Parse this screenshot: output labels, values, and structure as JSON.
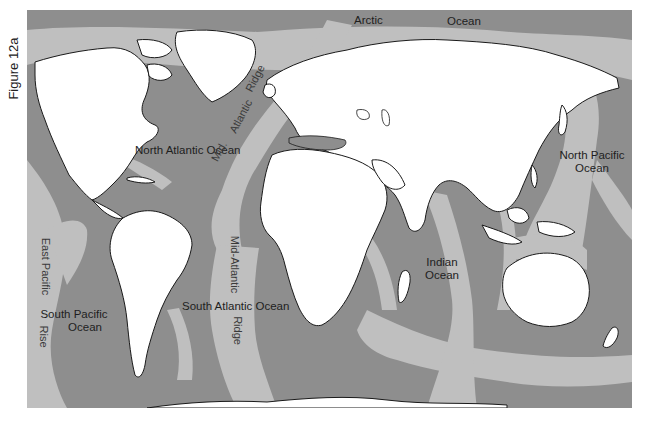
{
  "figure": {
    "label": "Figure 12a"
  },
  "map": {
    "title": "World map of ocean basins and mid-ocean ridges",
    "colors": {
      "deep_ocean": "#8e8e8e",
      "ridge_and_shelf": "#bfbfbf",
      "land": "#ffffff",
      "coastline": "#1a1a1a"
    },
    "labels": {
      "arctic": "Arctic",
      "arctic_ocean": "Ocean",
      "north_atlantic": "North Atlantic Ocean",
      "mid_atlantic_ridge_north_1": "Mid.",
      "mid_atlantic_ridge_north_2": "Atlantic",
      "mid_atlantic_ridge_north_3": "Ridge",
      "north_pacific_line1": "North Pacific",
      "north_pacific_line2": "Ocean",
      "east_pacific_rise_1": "East Pacific",
      "east_pacific_rise_2": "Rise",
      "south_pacific_line1": "South Pacific",
      "south_pacific_line2": "Ocean",
      "mid_atlantic_ridge_south_1": "Mid-Atlantic",
      "mid_atlantic_ridge_south_2": "Ridge",
      "south_atlantic": "South Atlantic Ocean",
      "indian_line1": "Indian",
      "indian_line2": "Ocean"
    }
  }
}
